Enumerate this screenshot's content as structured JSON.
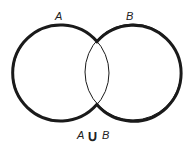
{
  "diagram": {
    "type": "venn",
    "sets": [
      {
        "name": "A",
        "label": "A",
        "cx": 61,
        "cy": 73,
        "r": 48
      },
      {
        "name": "B",
        "label": "B",
        "cx": 133,
        "cy": 72,
        "r": 48
      }
    ],
    "caption": {
      "left": "A",
      "operator": "∪",
      "right": "B"
    },
    "stroke_color": "#1a1a1a",
    "outer_stroke_width": 3,
    "inner_stroke_width": 1
  }
}
